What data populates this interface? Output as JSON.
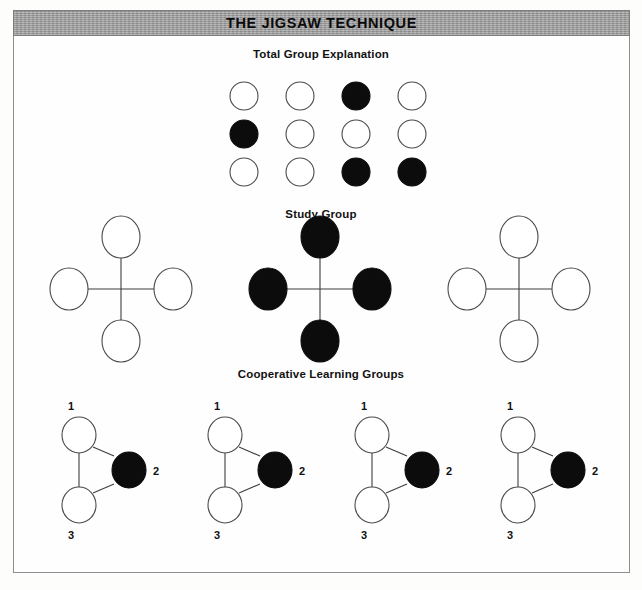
{
  "document": {
    "title": "THE JIGSAW TECHNIQUE",
    "frame_border_color": "#8e8e8e",
    "title_band_color": "#9b9b9b",
    "background_color": "#fdfdfc"
  },
  "palette": {
    "open_node_fill": "#ffffff",
    "open_node_stroke": "#4a4a4a",
    "filled_node_fill": "#0c0c0c",
    "link_color": "#3d3d3d",
    "text_color": "#101010"
  },
  "sections": {
    "total_group": {
      "heading": "Total Group Explanation",
      "layout": "grid",
      "columns": 4,
      "rows": 3,
      "circle_diameter": 28,
      "col_spacing": 56,
      "row_spacing": 38,
      "origin": {
        "x": 244,
        "y": 96
      },
      "cells": [
        [
          {
            "id": "r1c1",
            "state": "open"
          },
          {
            "id": "r1c2",
            "state": "open"
          },
          {
            "id": "r1c3",
            "state": "filled"
          },
          {
            "id": "r1c4",
            "state": "open"
          }
        ],
        [
          {
            "id": "r2c1",
            "state": "filled"
          },
          {
            "id": "r2c2",
            "state": "open"
          },
          {
            "id": "r2c3",
            "state": "open"
          },
          {
            "id": "r2c4",
            "state": "open"
          }
        ],
        [
          {
            "id": "r3c1",
            "state": "open"
          },
          {
            "id": "r3c2",
            "state": "open"
          },
          {
            "id": "r3c3",
            "state": "filled"
          },
          {
            "id": "r3c4",
            "state": "filled"
          }
        ]
      ]
    },
    "study_group": {
      "heading": "Study Group",
      "layout": "cross",
      "circle_rx": 19,
      "circle_ry": 21,
      "arm_length": 52,
      "clusters": [
        {
          "id": "study-cluster-1",
          "center": {
            "x": 121,
            "y": 289
          },
          "nodes": [
            {
              "position": "top",
              "state": "open"
            },
            {
              "position": "right",
              "state": "open"
            },
            {
              "position": "bottom",
              "state": "open"
            },
            {
              "position": "left",
              "state": "open"
            }
          ]
        },
        {
          "id": "study-cluster-2",
          "center": {
            "x": 320,
            "y": 289
          },
          "nodes": [
            {
              "position": "top",
              "state": "filled"
            },
            {
              "position": "right",
              "state": "filled"
            },
            {
              "position": "bottom",
              "state": "filled"
            },
            {
              "position": "left",
              "state": "filled"
            }
          ]
        },
        {
          "id": "study-cluster-3",
          "center": {
            "x": 519,
            "y": 289
          },
          "nodes": [
            {
              "position": "top",
              "state": "open"
            },
            {
              "position": "right",
              "state": "open"
            },
            {
              "position": "bottom",
              "state": "open"
            },
            {
              "position": "left",
              "state": "open"
            }
          ]
        }
      ]
    },
    "cooperative_groups": {
      "heading": "Cooperative Learning Groups",
      "layout": "triangle",
      "circle_rx": 17,
      "circle_ry": 18,
      "groups": [
        {
          "id": "coop-group-1",
          "origin": {
            "x": 79,
            "y": 435
          },
          "nodes": [
            {
              "label": "1",
              "state": "open",
              "label_side": "top"
            },
            {
              "label": "2",
              "state": "filled",
              "label_side": "right"
            },
            {
              "label": "3",
              "state": "open",
              "label_side": "bottom"
            }
          ]
        },
        {
          "id": "coop-group-2",
          "origin": {
            "x": 225,
            "y": 435
          },
          "nodes": [
            {
              "label": "1",
              "state": "open",
              "label_side": "top"
            },
            {
              "label": "2",
              "state": "filled",
              "label_side": "right"
            },
            {
              "label": "3",
              "state": "open",
              "label_side": "bottom"
            }
          ]
        },
        {
          "id": "coop-group-3",
          "origin": {
            "x": 372,
            "y": 435
          },
          "nodes": [
            {
              "label": "1",
              "state": "open",
              "label_side": "top"
            },
            {
              "label": "2",
              "state": "filled",
              "label_side": "right"
            },
            {
              "label": "3",
              "state": "open",
              "label_side": "bottom"
            }
          ]
        },
        {
          "id": "coop-group-4",
          "origin": {
            "x": 518,
            "y": 435
          },
          "nodes": [
            {
              "label": "1",
              "state": "open",
              "label_side": "top"
            },
            {
              "label": "2",
              "state": "filled",
              "label_side": "right"
            },
            {
              "label": "3",
              "state": "open",
              "label_side": "bottom"
            }
          ]
        }
      ]
    }
  }
}
